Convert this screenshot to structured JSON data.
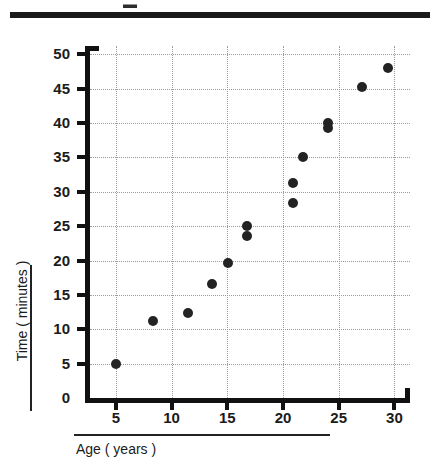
{
  "figure": {
    "title": "",
    "top_rule": "divider"
  },
  "axes": {
    "x_title": "Age ( years )",
    "y_title": "Time ( minutes )",
    "x_ticks": [
      5,
      10,
      15,
      20,
      25,
      30
    ],
    "y_ticks": [
      0,
      5,
      10,
      15,
      20,
      25,
      30,
      35,
      40,
      45,
      50
    ],
    "x_min": 2.5,
    "x_max": 31.4,
    "y_min": 0,
    "y_max": 51.2
  },
  "chart_data": {
    "type": "scatter",
    "title": "",
    "xlabel": "Age ( years )",
    "ylabel": "Time ( minutes )",
    "xlim": [
      2.5,
      31.4
    ],
    "ylim": [
      0,
      51.2
    ],
    "xticks": [
      5,
      10,
      15,
      20,
      25,
      30
    ],
    "yticks": [
      0,
      5,
      10,
      15,
      20,
      25,
      30,
      35,
      40,
      45,
      50
    ],
    "grid": true,
    "grid_style": "dotted",
    "legend": null,
    "marker": {
      "shape": "circle",
      "color": "#232323",
      "size": 10
    },
    "points": [
      {
        "x": 5.0,
        "y": 5.0
      },
      {
        "x": 8.3,
        "y": 11.2
      },
      {
        "x": 11.5,
        "y": 12.4
      },
      {
        "x": 13.6,
        "y": 16.6
      },
      {
        "x": 15.1,
        "y": 19.7
      },
      {
        "x": 16.8,
        "y": 23.6
      },
      {
        "x": 16.8,
        "y": 25.0
      },
      {
        "x": 20.9,
        "y": 28.4
      },
      {
        "x": 20.9,
        "y": 31.3
      },
      {
        "x": 21.8,
        "y": 35.0
      },
      {
        "x": 24.0,
        "y": 39.3
      },
      {
        "x": 24.0,
        "y": 40.0
      },
      {
        "x": 27.1,
        "y": 45.2
      },
      {
        "x": 29.4,
        "y": 48.0
      }
    ]
  }
}
